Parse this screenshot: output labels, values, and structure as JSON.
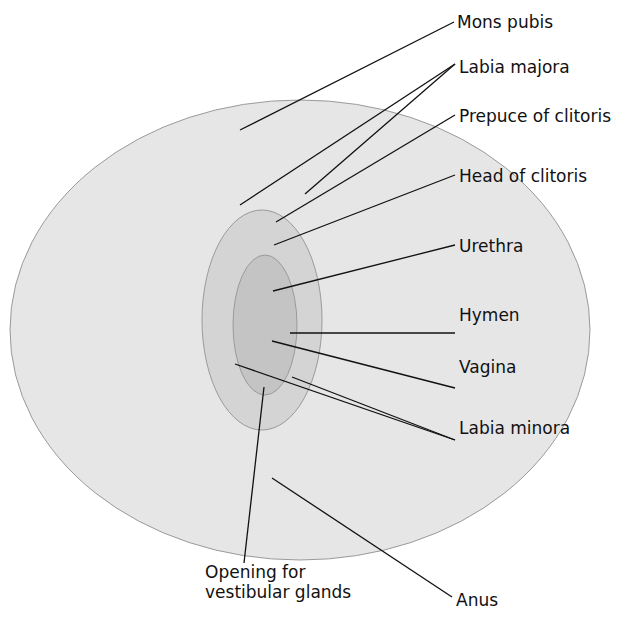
{
  "diagram": {
    "type": "anatomical-label-diagram",
    "illustration": "schematic-placeholder",
    "colors": {
      "line": "#111111",
      "text": "#111111",
      "shape_fill": "#e6e6e6",
      "shape_stroke": "#9a9a9a"
    },
    "labels": [
      {
        "id": "mons-pubis",
        "text": "Mons pubis",
        "x": 457,
        "y": 12
      },
      {
        "id": "labia-majora",
        "text": "Labia majora",
        "x": 459,
        "y": 57
      },
      {
        "id": "prepuce-clitoris",
        "text": "Prepuce of clitoris",
        "x": 459,
        "y": 106
      },
      {
        "id": "head-clitoris",
        "text": "Head of clitoris",
        "x": 459,
        "y": 166
      },
      {
        "id": "urethra",
        "text": "Urethra",
        "x": 459,
        "y": 236
      },
      {
        "id": "hymen",
        "text": "Hymen",
        "x": 459,
        "y": 305
      },
      {
        "id": "vagina",
        "text": "Vagina",
        "x": 459,
        "y": 357
      },
      {
        "id": "labia-minora",
        "text": "Labia minora",
        "x": 459,
        "y": 418
      },
      {
        "id": "opening-glands",
        "text": "Opening for\nvestibular glands",
        "x": 205,
        "y": 562
      },
      {
        "id": "anus",
        "text": "Anus",
        "x": 456,
        "y": 590
      }
    ],
    "leaders": [
      {
        "for": "mons-pubis",
        "x1": 454,
        "y1": 22,
        "x2": 240,
        "y2": 130
      },
      {
        "for": "labia-majora",
        "x1": 455,
        "y1": 64,
        "x2": 240,
        "y2": 205
      },
      {
        "for": "labia-majora",
        "x1": 455,
        "y1": 64,
        "x2": 305,
        "y2": 194
      },
      {
        "for": "prepuce-clitoris",
        "x1": 455,
        "y1": 115,
        "x2": 276,
        "y2": 222
      },
      {
        "for": "head-clitoris",
        "x1": 455,
        "y1": 175,
        "x2": 274,
        "y2": 245
      },
      {
        "for": "urethra",
        "x1": 455,
        "y1": 245,
        "x2": 273,
        "y2": 291
      },
      {
        "for": "hymen",
        "x1": 455,
        "y1": 333,
        "x2": 290,
        "y2": 333
      },
      {
        "for": "vagina",
        "x1": 455,
        "y1": 388,
        "x2": 272,
        "y2": 341
      },
      {
        "for": "labia-minora",
        "x1": 455,
        "y1": 440,
        "x2": 235,
        "y2": 364
      },
      {
        "for": "labia-minora",
        "x1": 455,
        "y1": 440,
        "x2": 292,
        "y2": 377
      },
      {
        "for": "opening-glands",
        "x1": 244,
        "y1": 563,
        "x2": 264,
        "y2": 387
      },
      {
        "for": "anus",
        "x1": 452,
        "y1": 597,
        "x2": 272,
        "y2": 478
      }
    ]
  }
}
